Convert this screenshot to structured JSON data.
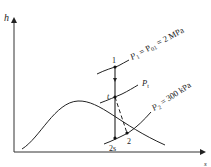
{
  "diagram": {
    "type": "h-s diagram",
    "axes": {
      "y_label": "h",
      "x_label": "s"
    },
    "states": [
      {
        "id": "1",
        "label": "1"
      },
      {
        "id": "t",
        "label": "t"
      },
      {
        "id": "2s",
        "label": "2s"
      },
      {
        "id": "2",
        "label": "2"
      }
    ],
    "isobars": [
      {
        "id": "p1",
        "label_main": "P",
        "label_sub": "1",
        "label_rest": " = P",
        "label_sub2": "01",
        "label_tail": " = 2 MPa"
      },
      {
        "id": "pt",
        "label_main": "P",
        "label_sub": "t"
      },
      {
        "id": "p2",
        "label_main": "P",
        "label_sub": "2",
        "label_tail": " = 300 kPa"
      }
    ],
    "colors": {
      "line": "#222222",
      "background": "#ffffff"
    }
  }
}
